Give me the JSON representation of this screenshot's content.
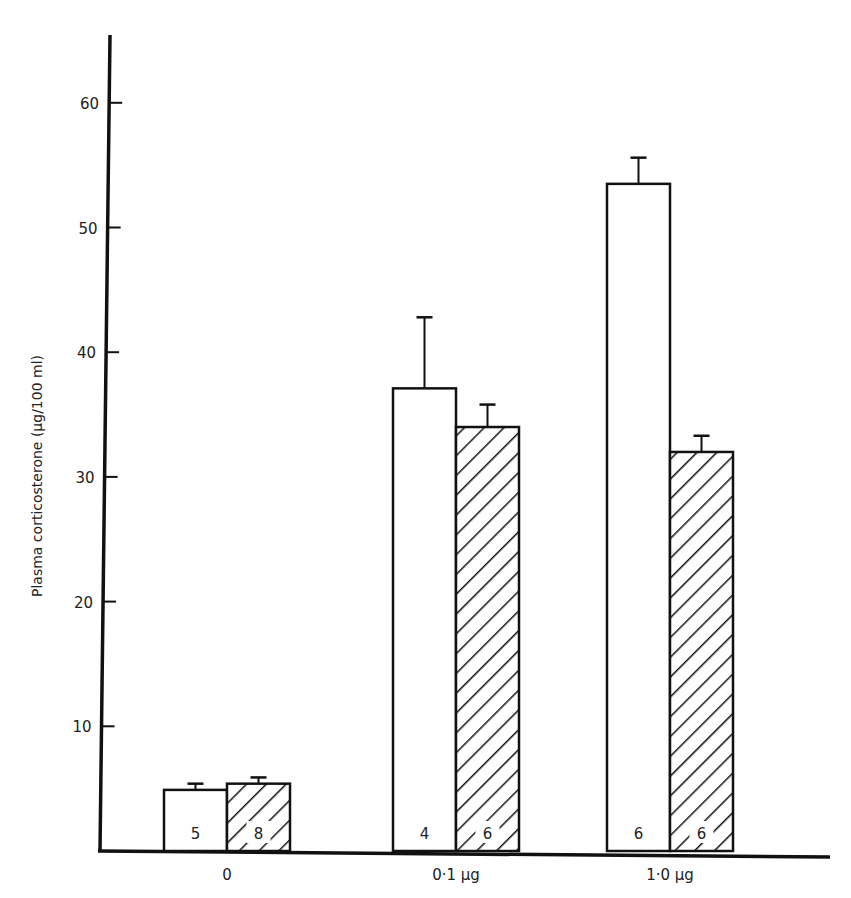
{
  "chart_data": {
    "type": "bar",
    "title": "",
    "xlabel": "",
    "ylabel": "Plasma corticosterone (µg/100 ml)",
    "ylim": [
      0,
      65
    ],
    "yticks": [
      10,
      20,
      30,
      40,
      50,
      60
    ],
    "grid": false,
    "legend": null,
    "categories": [
      "0",
      "0·1 µg",
      "1·0 µg"
    ],
    "series": [
      {
        "name": "open",
        "fill": "open",
        "values": [
          4.9,
          37.1,
          53.5
        ],
        "error_upper": [
          0.5,
          5.7,
          2.1
        ],
        "n": [
          "5",
          "4",
          "6"
        ]
      },
      {
        "name": "hatched",
        "fill": "hatched",
        "values": [
          5.4,
          34.0,
          32.0
        ],
        "error_upper": [
          0.5,
          1.8,
          1.3
        ],
        "n": [
          "8",
          "6",
          "6"
        ]
      }
    ]
  },
  "axis": {
    "y_tick_labels": [
      "10",
      "20",
      "30",
      "40",
      "50",
      "60"
    ]
  },
  "colors": {
    "ink": "#111111",
    "background": "#ffffff"
  }
}
